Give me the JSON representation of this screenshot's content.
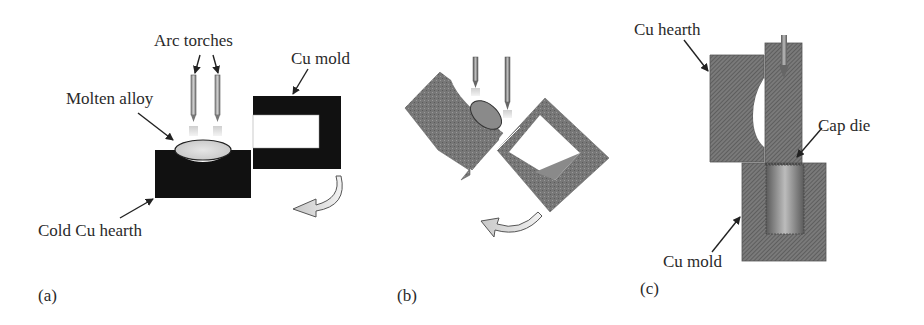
{
  "figure": {
    "panels": [
      {
        "id": "a",
        "label": "(a)",
        "annotations": {
          "arc_torches": "Arc torches",
          "cu_mold": "Cu mold",
          "molten_alloy": "Molten alloy",
          "cold_cu_hearth": "Cold Cu hearth"
        }
      },
      {
        "id": "b",
        "label": "(b)",
        "annotations": {}
      },
      {
        "id": "c",
        "label": "(c)",
        "annotations": {
          "cu_hearth": "Cu hearth",
          "cap_die": "Cap die",
          "cu_mold": "Cu mold"
        }
      }
    ],
    "colors": {
      "solid_block": "#111111",
      "hatched_gray": "#6b6b6b",
      "molten": "#d8d8d8",
      "arrow_fill": "#d9d9d9",
      "text": "#2a2a2a"
    }
  }
}
